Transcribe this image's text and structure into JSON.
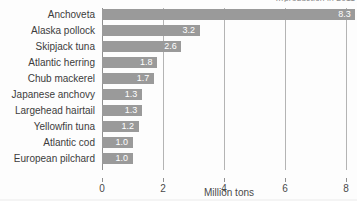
{
  "title": {
    "text": "…production in 2011",
    "clipped": true
  },
  "axis": {
    "x_title": "Million tons",
    "x_ticks": [
      "0",
      "2",
      "4",
      "6",
      "8"
    ],
    "x_tick_values": [
      0,
      2,
      4,
      6,
      8
    ]
  },
  "colors": {
    "bar": "#9a9a9a",
    "gridline": "#b4b4b4",
    "axis": "#8f8f8f",
    "background": "#fdfdfd",
    "value_label": "#ffffff",
    "text": "#3c3c3c"
  },
  "chart_data": {
    "type": "bar",
    "orientation": "horizontal",
    "title": "…production in 2011",
    "xlabel": "Million tons",
    "ylabel": "",
    "xlim": [
      0,
      8.5
    ],
    "grid": true,
    "legend": false,
    "categories": [
      "Anchoveta",
      "Alaska pollock",
      "Skipjack tuna",
      "Atlantic herring",
      "Chub mackerel",
      "Japanese anchovy",
      "Largehead hairtail",
      "Yellowfin tuna",
      "Atlantic cod",
      "European pilchard"
    ],
    "values": [
      8.3,
      3.2,
      2.6,
      1.8,
      1.7,
      1.3,
      1.3,
      1.2,
      1.0,
      1.0
    ],
    "value_labels": [
      "8.3",
      "3.2",
      "2.6",
      "1.8",
      "1.7",
      "1.3",
      "1.3",
      "1.2",
      "1.0",
      "1.0"
    ]
  }
}
